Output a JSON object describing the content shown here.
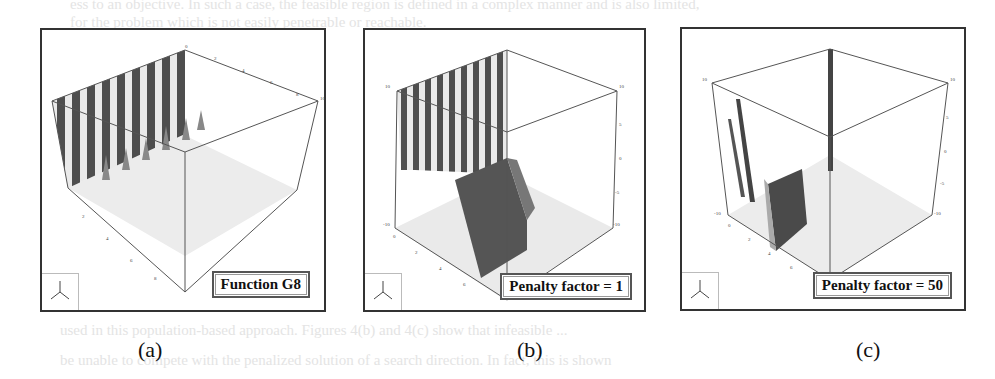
{
  "figure": {
    "panels": [
      {
        "id": "a",
        "caption": "(a)",
        "legend": "Function G8",
        "description": "3D surface plot of function G8 with oscillating ridges along back wall",
        "axis_ticks": {
          "x": [
            "0",
            "2",
            "4",
            "6",
            "8",
            "10"
          ],
          "y": [
            "0",
            "2",
            "4",
            "6",
            "8",
            "10"
          ]
        }
      },
      {
        "id": "b",
        "caption": "(b)",
        "legend": "Penalty factor = 1",
        "description": "3D surface with penalty factor 1, ridges plus dark penalized plane",
        "axis_ticks": {
          "x": [
            "0",
            "2",
            "4",
            "6",
            "8",
            "10"
          ],
          "y": [
            "0",
            "2",
            "4",
            "6",
            "8",
            "10"
          ],
          "z": [
            "-10",
            "-5",
            "0",
            "5",
            "10"
          ]
        }
      },
      {
        "id": "c",
        "caption": "(c)",
        "legend": "Penalty factor = 50",
        "description": "3D surface with penalty factor 50, isolated thin spikes and dark plane",
        "axis_ticks": {
          "x": [
            "0",
            "2",
            "4",
            "6",
            "8",
            "10"
          ],
          "y": [
            "0",
            "2",
            "4",
            "6",
            "8",
            "10"
          ],
          "z": [
            "-10",
            "-5",
            "0",
            "5",
            "10"
          ]
        }
      }
    ],
    "bleed_through_text": [
      "ess to an objective. In such a case, the feasible region is defined in a complex manner and is also limited,",
      "for the problem which is not easily penetrable or reachable.",
      "used in this population-based approach. Figures 4(b) and 4(c) show that infeasible ...",
      "be unable to compete with the penalized solution of a search direction. In fact, this is shown"
    ]
  }
}
